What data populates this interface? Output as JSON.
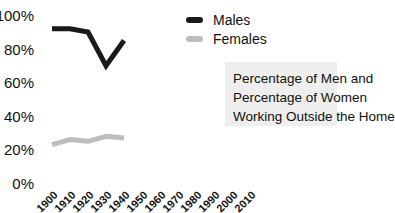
{
  "chart_data": {
    "type": "line",
    "title": "Percentage of Men and Percentage of Women Working Outside the Home",
    "title_lines": [
      "Percentage of Men and",
      "Percentage of Women",
      "Working Outside the Home"
    ],
    "xlabel": "",
    "ylabel": "",
    "x": [
      "1900",
      "1910",
      "1920",
      "1930",
      "1940",
      "1950",
      "1960",
      "1970",
      "1980",
      "1990",
      "2000",
      "2010"
    ],
    "yticks": [
      "100%",
      "80%",
      "60%",
      "40%",
      "20%",
      "0%"
    ],
    "ylim": [
      0,
      100
    ],
    "grid": false,
    "legend_position": "upper right",
    "series": [
      {
        "name": "Males",
        "color": "#1a1a1a",
        "values": [
          93,
          93,
          91,
          71,
          86,
          null,
          null,
          null,
          null,
          null,
          null,
          null
        ]
      },
      {
        "name": "Females",
        "color": "#bdbdbd",
        "values": [
          24,
          27,
          26,
          29,
          28,
          null,
          null,
          null,
          null,
          null,
          null,
          null
        ]
      }
    ]
  }
}
